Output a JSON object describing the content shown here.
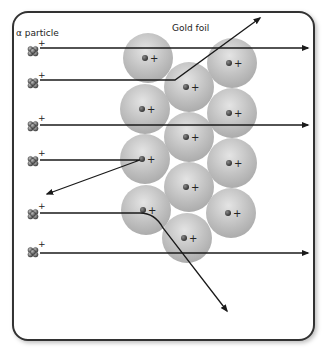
{
  "labels": {
    "alpha_particle": "α particle",
    "gold_foil": "Gold foil"
  },
  "colors": {
    "frame": "#333333",
    "atom_fill": "#bdbdbd",
    "atom_highlight": "#e2e2e2",
    "nucleus": "#444444",
    "path": "#1a1a1a",
    "background": "#ffffff"
  },
  "nucleus_charge": "+",
  "alpha_charge": "+",
  "atoms": [
    {
      "cx": 148,
      "cy": 58
    },
    {
      "cx": 232,
      "cy": 63
    },
    {
      "cx": 189,
      "cy": 87
    },
    {
      "cx": 145,
      "cy": 109
    },
    {
      "cx": 232,
      "cy": 113
    },
    {
      "cx": 189,
      "cy": 137
    },
    {
      "cx": 145,
      "cy": 159
    },
    {
      "cx": 232,
      "cy": 163
    },
    {
      "cx": 189,
      "cy": 187
    },
    {
      "cx": 146,
      "cy": 210
    },
    {
      "cx": 231,
      "cy": 213
    },
    {
      "cx": 187,
      "cy": 238
    }
  ],
  "alpha_particles": [
    {
      "x": 33,
      "y": 51
    },
    {
      "x": 33,
      "y": 83
    },
    {
      "x": 33,
      "y": 126
    },
    {
      "x": 33,
      "y": 161
    },
    {
      "x": 33,
      "y": 214
    },
    {
      "x": 33,
      "y": 252
    }
  ],
  "trajectories": [
    {
      "name": "undeflected-1",
      "d": "M40 48 L308 48"
    },
    {
      "name": "deflected-up",
      "d": "M40 80 L175 80 L260 18"
    },
    {
      "name": "undeflected-2",
      "d": "M40 125 L308 125"
    },
    {
      "name": "reflected-back",
      "d": "M40 160 L140 160 L47 194"
    },
    {
      "name": "deflected-down",
      "d": "M40 213 L140 213 Q155 213 163 228 L227 311"
    },
    {
      "name": "undeflected-3",
      "d": "M40 253 L308 253"
    }
  ]
}
